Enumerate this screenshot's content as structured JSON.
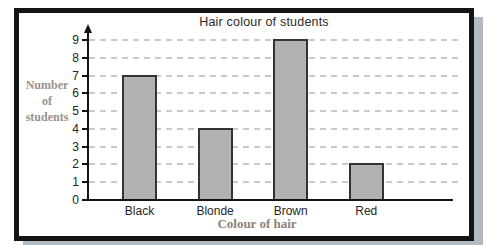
{
  "chart_data": {
    "type": "bar",
    "title": "Hair colour of students",
    "categories": [
      "Black",
      "Blonde",
      "Brown",
      "Red"
    ],
    "values": [
      7,
      4,
      9,
      2
    ],
    "xlabel": "Colour of hair",
    "ylabel_lines": [
      "Number",
      "of",
      "students"
    ],
    "ylim": [
      0,
      9
    ],
    "ytick_step": 1,
    "grid": "horizontal-dashed",
    "legend": "none",
    "colors": {
      "bar_fill": "#b2b2b2",
      "bar_border": "#333333",
      "axis": "#141414",
      "gridline": "#c9c9c9",
      "tick_label": "#222222",
      "title_text": "#2b2b2b",
      "axis_label_text": "#8d8176",
      "frame_border": "#141414",
      "frame_shadow": "#b2bac1"
    }
  }
}
